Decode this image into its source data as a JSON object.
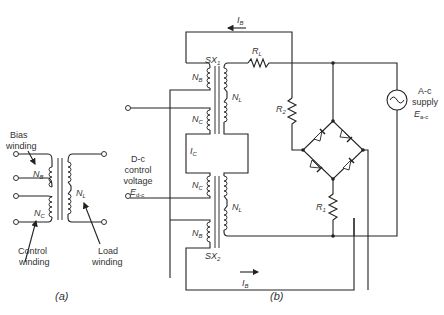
{
  "figure": {
    "part_a": {
      "caption": "(a)",
      "labels": {
        "bias_winding_line1": "Bias",
        "bias_winding_line2": "winding",
        "control_winding_line1": "Control",
        "control_winding_line2": "winding",
        "load_winding_line1": "Load",
        "load_winding_line2": "winding",
        "nb": "N",
        "nb_sub": "B",
        "nc": "N",
        "nc_sub": "C",
        "nl": "N",
        "nl_sub": "L"
      }
    },
    "part_b": {
      "caption": "(b)",
      "labels": {
        "ib_top": "I",
        "ib_top_sub": "B",
        "ib_bottom": "I",
        "ib_bottom_sub": "B",
        "ic": "I",
        "ic_sub": "C",
        "sx1": "SX",
        "sx1_sub": "1",
        "sx2": "SX",
        "sx2_sub": "2",
        "rl": "R",
        "rl_sub": "L",
        "r1": "R",
        "r1_sub": "1",
        "r2": "R",
        "r2_sub": "2",
        "nb": "N",
        "nb_sub": "B",
        "nc": "N",
        "nc_sub": "C",
        "nl": "N",
        "nl_sub": "L",
        "dc_line1": "D-c",
        "dc_line2": "control",
        "dc_line3": "voltage",
        "edc": "E",
        "edc_sub": "d-c",
        "ac_line1": "A-c",
        "ac_line2": "supply",
        "eac": "E",
        "eac_sub": "a-c"
      }
    }
  }
}
